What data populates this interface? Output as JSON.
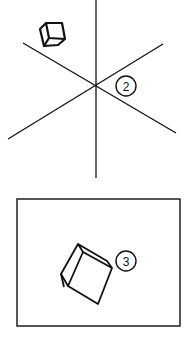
{
  "figure": {
    "panel_top": {
      "label": "2",
      "description": "Three intersecting axes with a small cube floating upper-left",
      "axes": [
        {
          "name": "vertical-axis",
          "x1": 96,
          "y1": 0,
          "x2": 96,
          "y2": 178
        },
        {
          "name": "diagonal-axis-a",
          "x1": 23,
          "y1": 43,
          "x2": 176,
          "y2": 133
        },
        {
          "name": "diagonal-axis-b",
          "x1": 8,
          "y1": 139,
          "x2": 163,
          "y2": 44
        }
      ],
      "intersection": [
        96,
        86
      ],
      "label_position": [
        126,
        86
      ]
    },
    "panel_bottom": {
      "label": "3",
      "description": "Framed rectangle containing a tilted cube",
      "frame": {
        "x": 17,
        "y": 199,
        "width": 163,
        "height": 127
      },
      "label_position": [
        126,
        261
      ]
    },
    "stroke_color": "#111111",
    "background_color": "#ffffff"
  }
}
